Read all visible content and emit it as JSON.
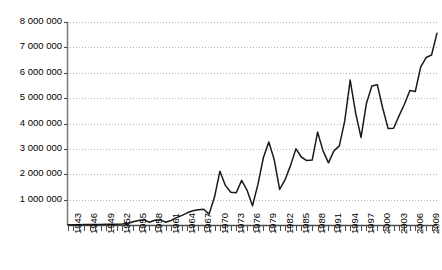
{
  "chart_data": {
    "type": "line",
    "title": "",
    "subtitle": "",
    "xlabel": "",
    "ylabel": "",
    "grid": true,
    "legend": null,
    "xlim": [
      1943,
      2011
    ],
    "ylim": [
      0,
      8000000
    ],
    "ytick_values": [
      1000000,
      2000000,
      3000000,
      4000000,
      5000000,
      6000000,
      7000000,
      8000000
    ],
    "ytick_labels": [
      "1 000 000",
      "2 000 000",
      "3 000 000",
      "4 000 000",
      "5 000 000",
      "6 000 000",
      "7 000 000",
      "8 000 000"
    ],
    "xtick_labels": [
      "1943",
      "1946",
      "1949",
      "1952",
      "1955",
      "1958",
      "1961",
      "1964",
      "1967",
      "1970",
      "1973",
      "1976",
      "1979",
      "1982",
      "1985",
      "1988",
      "1991",
      "1994",
      "1997",
      "2000",
      "2003",
      "2006",
      "2009"
    ],
    "xtick_step_years": 3,
    "series": [
      {
        "name": "series-1",
        "color": "#1a1a1a",
        "x": [
          1943,
          1944,
          1945,
          1946,
          1947,
          1948,
          1949,
          1950,
          1951,
          1952,
          1953,
          1954,
          1955,
          1956,
          1957,
          1958,
          1959,
          1960,
          1961,
          1962,
          1963,
          1964,
          1965,
          1966,
          1967,
          1968,
          1969,
          1970,
          1971,
          1972,
          1973,
          1974,
          1975,
          1976,
          1977,
          1978,
          1979,
          1980,
          1981,
          1982,
          1983,
          1984,
          1985,
          1986,
          1987,
          1988,
          1989,
          1990,
          1991,
          1992,
          1993,
          1994,
          1995,
          1996,
          1997,
          1998,
          1999,
          2000,
          2001,
          2002,
          2003,
          2004,
          2005,
          2006,
          2007,
          2008,
          2009,
          2010,
          2011
        ],
        "values": [
          10000,
          12000,
          14000,
          16000,
          18000,
          20000,
          22000,
          25000,
          28000,
          32000,
          40000,
          60000,
          130000,
          180000,
          200000,
          110000,
          190000,
          200000,
          110000,
          180000,
          290000,
          380000,
          480000,
          560000,
          600000,
          620000,
          430000,
          1100000,
          2120000,
          1560000,
          1290000,
          1270000,
          1760000,
          1370000,
          760000,
          1600000,
          2650000,
          3270000,
          2580000,
          1400000,
          1780000,
          2340000,
          3000000,
          2680000,
          2540000,
          2560000,
          3660000,
          2920000,
          2450000,
          2920000,
          3120000,
          4100000,
          5710000,
          4420000,
          3450000,
          4800000,
          5480000,
          5530000,
          4600000,
          3800000,
          3810000,
          4300000,
          4760000,
          5300000,
          5260000,
          6230000,
          6600000,
          6700000,
          7560000
        ]
      }
    ]
  },
  "axis": {
    "y_axis_name": "y-axis",
    "x_axis_name": "x-axis"
  }
}
